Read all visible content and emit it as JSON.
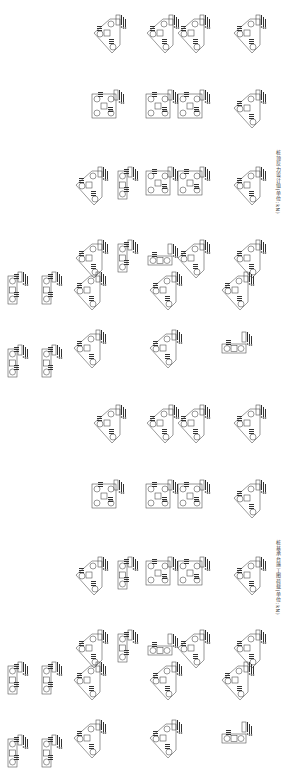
{
  "drawing": {
    "type": "pile-cap layout plan (CAD)",
    "line_color": "#333333",
    "background": "#ffffff",
    "panels": [
      {
        "caption": "桩顶反力设计值(单位:kN)",
        "caption_pos": {
          "x": 275,
          "y": 150
        },
        "offset_y": 0
      },
      {
        "caption": "桩基承台施工图荷载(单位:kN)",
        "caption_pos": {
          "x": 275,
          "y": 540
        },
        "offset_y": 390
      }
    ],
    "caps": [
      {
        "shape": "tri",
        "x": 92,
        "y": 15
      },
      {
        "shape": "tri",
        "x": 145,
        "y": 15
      },
      {
        "shape": "tri",
        "x": 176,
        "y": 15
      },
      {
        "shape": "tri",
        "x": 232,
        "y": 15
      },
      {
        "shape": "quad",
        "x": 92,
        "y": 90
      },
      {
        "shape": "quad",
        "x": 146,
        "y": 90
      },
      {
        "shape": "quad",
        "x": 178,
        "y": 90
      },
      {
        "shape": "tri",
        "x": 232,
        "y": 90
      },
      {
        "shape": "tri",
        "x": 74,
        "y": 167
      },
      {
        "shape": "rect2v",
        "x": 118,
        "y": 167
      },
      {
        "shape": "quad",
        "x": 146,
        "y": 167
      },
      {
        "shape": "quad",
        "x": 178,
        "y": 167
      },
      {
        "shape": "tri",
        "x": 232,
        "y": 167
      },
      {
        "shape": "tri",
        "x": 74,
        "y": 240
      },
      {
        "shape": "rect2v",
        "x": 118,
        "y": 240
      },
      {
        "shape": "rect2h",
        "x": 148,
        "y": 252
      },
      {
        "shape": "tri",
        "x": 176,
        "y": 240
      },
      {
        "shape": "tri",
        "x": 232,
        "y": 240
      },
      {
        "shape": "rect2v",
        "x": 8,
        "y": 272
      },
      {
        "shape": "rect2v",
        "x": 42,
        "y": 272
      },
      {
        "shape": "tri",
        "x": 72,
        "y": 272
      },
      {
        "shape": "tri",
        "x": 148,
        "y": 272
      },
      {
        "shape": "tri",
        "x": 220,
        "y": 272
      },
      {
        "shape": "rect2v",
        "x": 8,
        "y": 345
      },
      {
        "shape": "rect2v",
        "x": 42,
        "y": 345
      },
      {
        "shape": "tri",
        "x": 72,
        "y": 330
      },
      {
        "shape": "tri",
        "x": 148,
        "y": 330
      },
      {
        "shape": "rect2h",
        "x": 222,
        "y": 340
      }
    ]
  }
}
